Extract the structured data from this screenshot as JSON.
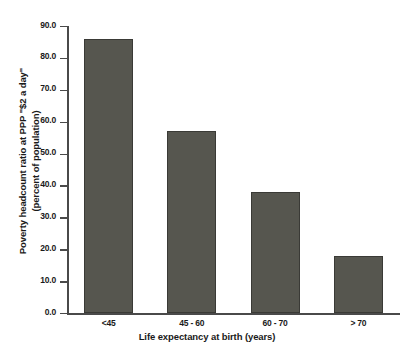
{
  "chart_data": {
    "type": "bar",
    "title": "",
    "subtitle": "",
    "categories": [
      "<45",
      "45 - 60",
      "60 - 70",
      "> 70"
    ],
    "values": [
      86.0,
      57.0,
      38.0,
      18.0
    ],
    "series": [
      {
        "name": "Poverty headcount ratio at PPP \"$2 a day\"",
        "values": [
          86.0,
          57.0,
          38.0,
          18.0
        ]
      }
    ],
    "xlabel": "Life expectancy at birth (years)",
    "ylabel": "Poverty headcount ratio at PPP \"$2 a day\" (percent of population)",
    "ylabel_line1": "Poverty headcount ratio at PPP \"$2 a day\"",
    "ylabel_line2": "(percent of population)",
    "ylim": [
      0.0,
      90.0
    ],
    "ytick_values": [
      0.0,
      10.0,
      20.0,
      30.0,
      40.0,
      50.0,
      60.0,
      70.0,
      80.0,
      90.0
    ],
    "ytick_labels": [
      "0.0",
      "10.0",
      "20.0",
      "30.0",
      "40.0",
      "50.0",
      "60.0",
      "70.0",
      "80.0",
      "90.0"
    ],
    "grid": false,
    "legend": false,
    "legend_position": "none",
    "bar_color": "#56564f",
    "bar_edge_color": "#3a3a36",
    "axis_color": "#4a4a4a",
    "background_color": "#ffffff",
    "text_color": "#1a1a1a"
  }
}
